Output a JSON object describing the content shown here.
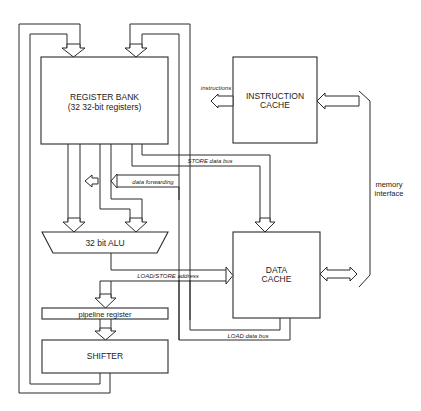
{
  "diagram": {
    "blocks": {
      "register_bank": {
        "title": "REGISTER BANK",
        "subtitle": "(32 32-bit registers)"
      },
      "instruction_cache": {
        "line1": "INSTRUCTION",
        "line2": "CACHE"
      },
      "data_cache": {
        "line1": "DATA",
        "line2": "CACHE"
      },
      "alu": {
        "label": "32 bit ALU"
      },
      "pipeline_register": {
        "label": "pipeline register"
      },
      "shifter": {
        "label": "SHIFTER"
      }
    },
    "buses": {
      "instructions": "instructions",
      "store_data_bus": "STORE data bus",
      "data_forwarding": "data forwarding",
      "load_store_address": "LOAD/STORE address",
      "load_data_bus": "LOAD data bus"
    },
    "memory_interface": {
      "line1": "memory",
      "line2": "interface"
    }
  }
}
